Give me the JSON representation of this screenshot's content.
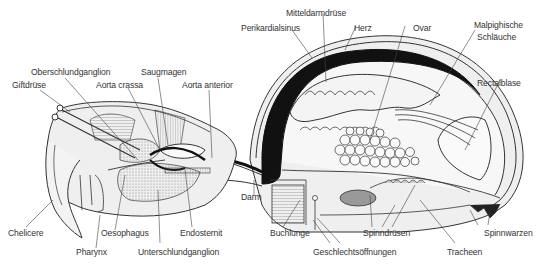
{
  "diagram": {
    "colors": {
      "outline": "#333333",
      "fill_light": "#eeeeee",
      "fill_mid": "#dddddd",
      "heart_black": "#111111",
      "stipple": "#bbbbbb",
      "text": "#333333"
    },
    "labels": {
      "perikardialsinus": "Perikardialsinus",
      "mitteldarmdruese": "Mitteldarmdrüse",
      "herz": "Herz",
      "ovar": "Ovar",
      "malpighische_1": "Malpighische",
      "malpighische_2": "Schläuche",
      "rectalblase": "Rectalblase",
      "oberschlundganglion": "Oberschlundganglion",
      "saugmagen": "Saugmagen",
      "giftdruese": "Giftdrüse",
      "aorta_crassa": "Aorta crassa",
      "aorta_anterior": "Aorta anterior",
      "darm": "Darm",
      "chelicere": "Chelicere",
      "oesophagus": "Oesophagus",
      "endosternit": "Endosternit",
      "buchlunge": "Buchlunge",
      "spinndruesen": "Spinndrüsen",
      "spinnwarzen": "Spinnwarzen",
      "pharynx": "Pharynx",
      "unterschlundganglion": "Unterschlundganglion",
      "geschlechtsoeffnungen": "Geschlechtsöffnungen",
      "tracheen": "Tracheen"
    }
  }
}
